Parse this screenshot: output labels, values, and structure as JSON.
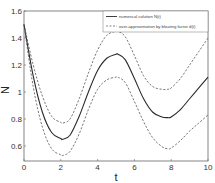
{
  "chart_data": {
    "type": "line",
    "title": "",
    "xlabel": "t",
    "ylabel": "N",
    "xlim": [
      0,
      10
    ],
    "ylim": [
      0.5,
      1.6
    ],
    "xticks": [
      "0",
      "2",
      "4",
      "6",
      "8",
      "10"
    ],
    "yticks": [
      "0.6",
      "0.8",
      "1",
      "1.2",
      "1.4",
      "1.6"
    ],
    "grid": false,
    "legend_position": "upper right",
    "x": [
      0,
      0.5,
      1,
      1.5,
      2,
      2.1,
      2.5,
      3,
      3.5,
      4,
      4.5,
      5,
      5.1,
      5.5,
      6,
      6.5,
      7,
      7.5,
      7.8,
      8,
      8.5,
      9,
      9.5,
      10
    ],
    "series": [
      {
        "name": "numerical solution N(t)",
        "style": "solid",
        "values": [
          1.5,
          1.12,
          0.85,
          0.7,
          0.655,
          0.65,
          0.68,
          0.82,
          1.0,
          1.16,
          1.25,
          1.28,
          1.28,
          1.24,
          1.1,
          0.95,
          0.85,
          0.815,
          0.81,
          0.815,
          0.87,
          0.95,
          1.03,
          1.11
        ]
      },
      {
        "name": "over-approximation by bloating factor d(t) (upper)",
        "style": "dashed",
        "values": [
          1.5,
          1.2,
          0.97,
          0.82,
          0.775,
          0.77,
          0.8,
          0.95,
          1.14,
          1.31,
          1.42,
          1.45,
          1.45,
          1.41,
          1.27,
          1.12,
          1.04,
          1.02,
          1.02,
          1.03,
          1.1,
          1.2,
          1.3,
          1.4
        ]
      },
      {
        "name": "over-approximation by bloating factor d(t) (lower)",
        "style": "dashed",
        "values": [
          1.5,
          1.04,
          0.74,
          0.58,
          0.535,
          0.53,
          0.56,
          0.69,
          0.87,
          1.02,
          1.09,
          1.11,
          1.11,
          1.07,
          0.93,
          0.78,
          0.66,
          0.595,
          0.58,
          0.585,
          0.64,
          0.71,
          0.77,
          0.83
        ]
      }
    ]
  },
  "legend": {
    "items": [
      {
        "label": "numerical solution N(t)",
        "style": "solid"
      },
      {
        "label": "over-approximation by bloating factor d(t)",
        "style": "dashed"
      }
    ]
  },
  "colors": {
    "line": "#2a2a2a",
    "dashed": "#555555",
    "axes": "#555555",
    "background": "#ffffff"
  }
}
